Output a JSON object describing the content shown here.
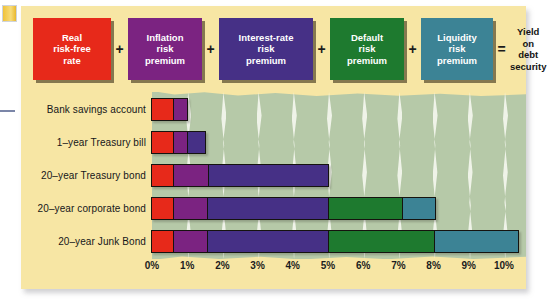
{
  "figure": {
    "panel_color": "#f7e6a4",
    "plot_field_color": "#b6c9a8"
  },
  "formula": {
    "boxes": [
      {
        "name": "real-risk-free-rate",
        "lines": [
          "Real",
          "risk-free",
          "rate"
        ],
        "color": "#e7291a"
      },
      {
        "name": "inflation-risk-premium",
        "lines": [
          "Inflation",
          "risk",
          "premium"
        ],
        "color": "#7b2381"
      },
      {
        "name": "interest-rate-risk-premium",
        "lines": [
          "Interest-rate",
          "risk",
          "premium"
        ],
        "color": "#463086"
      },
      {
        "name": "default-risk-premium",
        "lines": [
          "Default",
          "risk",
          "premium"
        ],
        "color": "#1e7a2f"
      },
      {
        "name": "liquidity-risk-premium",
        "lines": [
          "Liquidity",
          "risk",
          "premium"
        ],
        "color": "#3c8395"
      }
    ],
    "operators": [
      "+",
      "+",
      "+",
      "+",
      "="
    ],
    "result": {
      "lines": [
        "Yield on",
        "debt",
        "security"
      ]
    }
  },
  "chart_data": {
    "type": "bar",
    "orientation": "horizontal",
    "stacked": true,
    "title": "",
    "xlabel": "",
    "ylabel": "",
    "xlim": [
      0,
      10
    ],
    "xticks": [
      "0%",
      "1%",
      "2%",
      "3%",
      "4%",
      "5%",
      "6%",
      "7%",
      "8%",
      "9%",
      "10%"
    ],
    "grid": true,
    "legend": "none",
    "categories": [
      "Bank savings account",
      "1–year Treasury bill",
      "20–year Treasury bond",
      "20–year corporate bond",
      "20–year Junk Bond"
    ],
    "series": [
      {
        "name": "Real risk-free rate",
        "key": "real",
        "color": "#e7291a",
        "values": [
          0.6,
          0.6,
          0.6,
          0.6,
          0.6
        ]
      },
      {
        "name": "Inflation risk premium",
        "key": "infl",
        "color": "#7b2381",
        "values": [
          0.4,
          0.4,
          1.0,
          0.95,
          0.95
        ]
      },
      {
        "name": "Interest-rate risk premium",
        "key": "int",
        "color": "#463086",
        "values": [
          0.0,
          0.5,
          3.4,
          3.45,
          3.45
        ]
      },
      {
        "name": "Default risk premium",
        "key": "def",
        "color": "#1e7a2f",
        "values": [
          0.0,
          0.0,
          0.0,
          2.1,
          3.0
        ]
      },
      {
        "name": "Liquidity risk premium",
        "key": "liq",
        "color": "#3c8395",
        "values": [
          0.0,
          0.0,
          0.0,
          0.95,
          2.4
        ]
      }
    ],
    "totals": [
      1.0,
      1.5,
      5.0,
      8.05,
      10.4
    ]
  }
}
